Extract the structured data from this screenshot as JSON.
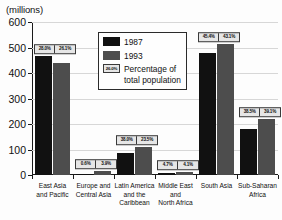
{
  "chart_data": {
    "type": "bar",
    "title": "",
    "ylabel": "(millions)",
    "xlabel": "",
    "ylim": [
      0,
      600
    ],
    "yticks": [
      0,
      100,
      200,
      300,
      400,
      500,
      600
    ],
    "ytick_labels": [
      "0",
      "100",
      "200",
      "300",
      "400",
      "500",
      "600"
    ],
    "grid": true,
    "legend_position": "upper-center",
    "categories": [
      "East Asia\nand Pacific",
      "Europe and\nCentral Asia",
      "Latin America\nand the\nCaribbean",
      "Middle East\nand\nNorth Africa",
      "South Asia",
      "Sub-Saharan\nAfrica"
    ],
    "series": [
      {
        "name": "1987",
        "color": "#111111",
        "values": [
          465,
          4,
          85,
          9,
          480,
          180
        ]
      },
      {
        "name": "1993",
        "color": "#4d4d4d",
        "values": [
          440,
          14,
          108,
          10,
          512,
          218
        ]
      }
    ],
    "annotations": {
      "label": "Percentage of total population",
      "values": [
        {
          "1987": "28.0%",
          "1993": "26.1%"
        },
        {
          "1987": "0.6%",
          "1993": "3.9%"
        },
        {
          "1987": "38.0%",
          "1993": "23.5%"
        },
        {
          "1987": "4.7%",
          "1993": "4.1%"
        },
        {
          "1987": "45.4%",
          "1993": "43.1%"
        },
        {
          "1987": "38.5%",
          "1993": "39.1%"
        }
      ]
    }
  },
  "legend": {
    "items": [
      {
        "label": "1987",
        "swatch": "black-square-icon"
      },
      {
        "label": "1993",
        "swatch": "gray-square-icon"
      },
      {
        "label": "Percentage of\ntotal population",
        "swatch": "percent-box-icon",
        "swatch_text": "26.0%"
      }
    ]
  }
}
